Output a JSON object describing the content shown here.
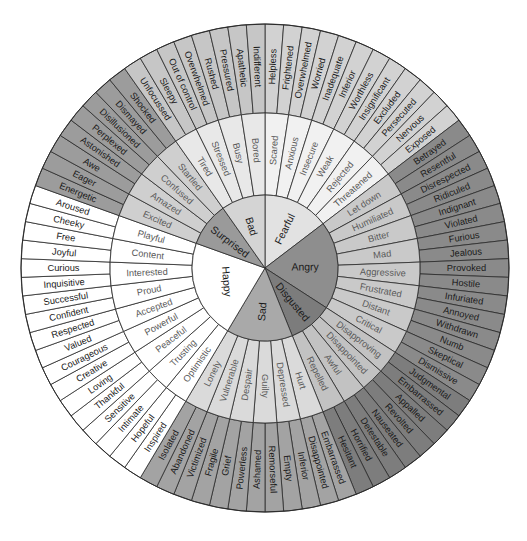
{
  "wheel": {
    "center": [
      265,
      268
    ],
    "radii": {
      "inner": 73,
      "middle": 155,
      "outer": 244
    },
    "start_angle_deg": 0,
    "groups": [
      {
        "name": "Fearful",
        "colors": {
          "inner": "#e2e2e2",
          "middle": "#f1f1f1",
          "outer": "#d2d2d2"
        },
        "middle": [
          {
            "name": "Scared",
            "outer": [
              "Helpless",
              "Frightened"
            ]
          },
          {
            "name": "Anxious",
            "outer": [
              "Overwhelmed",
              "Worried"
            ]
          },
          {
            "name": "Insecure",
            "outer": [
              "Inadequate",
              "Inferior"
            ]
          },
          {
            "name": "Weak",
            "outer": [
              "Worthless",
              "Insignificant"
            ]
          },
          {
            "name": "Rejected",
            "outer": [
              "Excluded",
              "Persecuted"
            ]
          },
          {
            "name": "Threatened",
            "outer": [
              "Nervous",
              "Exposed"
            ]
          }
        ]
      },
      {
        "name": "Angry",
        "colors": {
          "inner": "#8e8e8e",
          "middle": "#c9c9c9",
          "outer": "#8a8a8a"
        },
        "middle": [
          {
            "name": "Let down",
            "outer": [
              "Betrayed",
              "Resentful"
            ]
          },
          {
            "name": "Humiliated",
            "outer": [
              "Disrespected",
              "Ridiculed"
            ]
          },
          {
            "name": "Bitter",
            "outer": [
              "Indignant",
              "Violated"
            ]
          },
          {
            "name": "Mad",
            "outer": [
              "Furious",
              "Jealous"
            ]
          },
          {
            "name": "Aggressive",
            "outer": [
              "Provoked",
              "Hostile"
            ]
          },
          {
            "name": "Frustrated",
            "outer": [
              "Infuriated",
              "Annoyed"
            ]
          },
          {
            "name": "Distant",
            "outer": [
              "Withdrawn",
              "Numb"
            ]
          },
          {
            "name": "Critical",
            "outer": [
              "Skeptical",
              "Dismissive"
            ]
          }
        ]
      },
      {
        "name": "Disgusted",
        "colors": {
          "inner": "#7c7c7c",
          "middle": "#c2c2c2",
          "outer": "#7d7d7d"
        },
        "middle": [
          {
            "name": "Disapproving",
            "outer": [
              "Judgmental",
              "Embarrassed"
            ]
          },
          {
            "name": "Disappointed",
            "outer": [
              "Appalled",
              "Revolted"
            ]
          },
          {
            "name": "Awful",
            "outer": [
              "Nauseated",
              "Detestable"
            ]
          },
          {
            "name": "Repelled",
            "outer": [
              "Horrified",
              "Hesitant"
            ]
          }
        ]
      },
      {
        "name": "Sad",
        "colors": {
          "inner": "#a9a9a9",
          "middle": "#dadada",
          "outer": "#a3a3a3"
        },
        "middle": [
          {
            "name": "Hurt",
            "outer": [
              "Embarrassed",
              "Disappointed"
            ]
          },
          {
            "name": "Depressed",
            "outer": [
              "Inferior",
              "Empty"
            ]
          },
          {
            "name": "Guilty",
            "outer": [
              "Remorseful",
              "Ashamed"
            ]
          },
          {
            "name": "Despair",
            "outer": [
              "Powerless",
              "Grief"
            ]
          },
          {
            "name": "Vulnerable",
            "outer": [
              "Fragile",
              "Victimized"
            ]
          },
          {
            "name": "Lonely",
            "outer": [
              "Abandoned",
              "Isolated"
            ]
          }
        ]
      },
      {
        "name": "Happy",
        "colors": {
          "inner": "#ffffff",
          "middle": "#ffffff",
          "outer": "#ffffff"
        },
        "middle": [
          {
            "name": "Optimistic",
            "outer": [
              "Inspired",
              "Hopeful"
            ]
          },
          {
            "name": "Trusting",
            "outer": [
              "Intimate",
              "Sensitive"
            ]
          },
          {
            "name": "Peaceful",
            "outer": [
              "Thankful",
              "Loving"
            ]
          },
          {
            "name": "Powerful",
            "outer": [
              "Creative",
              "Courageous"
            ]
          },
          {
            "name": "Accepted",
            "outer": [
              "Valued",
              "Respected"
            ]
          },
          {
            "name": "Proud",
            "outer": [
              "Confident",
              "Successful"
            ]
          },
          {
            "name": "Interested",
            "outer": [
              "Inquisitive",
              "Curious"
            ]
          },
          {
            "name": "Content",
            "outer": [
              "Joyful",
              "Free"
            ]
          },
          {
            "name": "Playful",
            "outer": [
              "Cheeky",
              "Aroused"
            ]
          }
        ]
      },
      {
        "name": "Surprised",
        "colors": {
          "inner": "#9a9a9a",
          "middle": "#cfcfcf",
          "outer": "#9c9c9c"
        },
        "middle": [
          {
            "name": "Excited",
            "outer": [
              "Energetic",
              "Eager"
            ]
          },
          {
            "name": "Amazed",
            "outer": [
              "Awe",
              "Astonished"
            ]
          },
          {
            "name": "Confused",
            "outer": [
              "Perplexed",
              "Disillusioned"
            ]
          },
          {
            "name": "Startled",
            "outer": [
              "Dismayed",
              "Shocked"
            ]
          }
        ]
      },
      {
        "name": "Bad",
        "colors": {
          "inner": "#d4d4d4",
          "middle": "#e8e8e8",
          "outer": "#c6c6c6"
        },
        "middle": [
          {
            "name": "Tired",
            "outer": [
              "Unfocussed",
              "Sleepy"
            ]
          },
          {
            "name": "Stressed",
            "outer": [
              "Out of control",
              "Overwhelmed"
            ]
          },
          {
            "name": "Busy",
            "outer": [
              "Rushed",
              "Pressured"
            ]
          },
          {
            "name": "Bored",
            "outer": [
              "Apathetic",
              "Indifferent"
            ]
          }
        ]
      }
    ]
  }
}
